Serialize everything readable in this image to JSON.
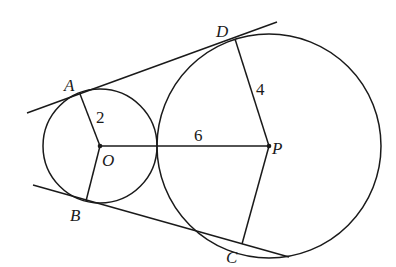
{
  "diagram": {
    "type": "geometry",
    "circles": [
      {
        "name": "small-circle",
        "center": "O",
        "radius_label": "2"
      },
      {
        "name": "large-circle",
        "center": "P",
        "radius_label": "4"
      }
    ],
    "points": {
      "A": "A",
      "B": "B",
      "C": "C",
      "D": "D",
      "O": "O",
      "P": "P"
    },
    "segments": {
      "OA": {
        "label": "2"
      },
      "PD": {
        "label": "4"
      },
      "OP": {
        "label": "6"
      }
    },
    "tangent_lines": [
      "AD",
      "BC"
    ],
    "colors": {
      "line": "#1a1a1a",
      "background": "#ffffff"
    }
  }
}
